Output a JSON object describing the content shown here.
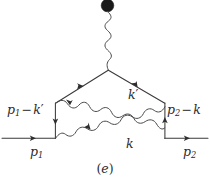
{
  "figure": {
    "kind": "feynman-diagram",
    "caption": "(e)",
    "caption_open": "(",
    "caption_letter": "e",
    "caption_close": ")",
    "background_color": "#ffffff",
    "line_color": "#3a3a3a",
    "wave_color": "#4a4a4a",
    "blob_color": "#1a1a1a",
    "label_color": "#2b2b2b"
  },
  "labels": {
    "p1_minus_kprime": {
      "base": "p",
      "sub": "1",
      "op": "−",
      "second": "k",
      "prime": "′"
    },
    "p2_minus_k": {
      "base": "p",
      "sub": "2",
      "op": "−",
      "second": "k",
      "prime": ""
    },
    "kprime": {
      "base": "k",
      "prime": "′"
    },
    "k": {
      "base": "k",
      "prime": ""
    },
    "p1": {
      "base": "p",
      "sub": "1"
    },
    "p2": {
      "base": "p",
      "sub": "2"
    }
  },
  "elements": {
    "external_photon_blob": "filled-vertex-blob",
    "external_photon_line": "wavy-photon-vertical",
    "top_vertex": "photon-fermion-vertex",
    "fermion_line_in": "p1-incoming-fermion",
    "fermion_line_out": "p2-outgoing-fermion",
    "left_vertical_fermion": "p1-minus-kprime-propagator",
    "right_vertical_fermion": "p2-minus-k-propagator",
    "left_diagonal_fermion": "upper-left-fermion",
    "right_diagonal_fermion": "upper-right-fermion",
    "photon_kprime": "crossed-photon-kprime",
    "photon_k": "crossed-photon-k"
  }
}
